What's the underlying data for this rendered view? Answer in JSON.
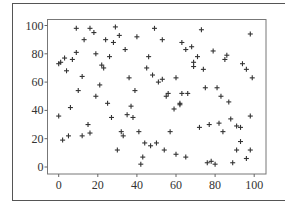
{
  "chart_data": {
    "type": "scatter",
    "title": "",
    "xlabel": "",
    "ylabel": "",
    "xlim": [
      -4,
      106
    ],
    "ylim": [
      -4,
      106
    ],
    "grid": false,
    "legend": null,
    "marker": "+",
    "marker_color": "#333333",
    "x_ticks": [
      0,
      20,
      40,
      60,
      80,
      100
    ],
    "y_ticks": [
      0,
      20,
      40,
      60,
      80,
      100
    ],
    "x_tick_labels": [
      "0",
      "20",
      "40",
      "60",
      "80",
      "100"
    ],
    "y_tick_labels": [
      "0",
      "20",
      "40",
      "60",
      "80",
      "100"
    ],
    "series": [
      {
        "name": "points",
        "points": [
          [
            9,
            98
          ],
          [
            16,
            98
          ],
          [
            18,
            95
          ],
          [
            29,
            99
          ],
          [
            31,
            93
          ],
          [
            13,
            90
          ],
          [
            24,
            90
          ],
          [
            28,
            88
          ],
          [
            40,
            92
          ],
          [
            34,
            83
          ],
          [
            9,
            81
          ],
          [
            19,
            80
          ],
          [
            3,
            77
          ],
          [
            26,
            78
          ],
          [
            7,
            76
          ],
          [
            1,
            74
          ],
          [
            0,
            73
          ],
          [
            22,
            72
          ],
          [
            23,
            70
          ],
          [
            4,
            68
          ],
          [
            12,
            64
          ],
          [
            36,
            63
          ],
          [
            21,
            58
          ],
          [
            10,
            54
          ],
          [
            39,
            54
          ],
          [
            19,
            50
          ],
          [
            25,
            45
          ],
          [
            49,
            98
          ],
          [
            73,
            97
          ],
          [
            98,
            94
          ],
          [
            53,
            90
          ],
          [
            63,
            88
          ],
          [
            68,
            85
          ],
          [
            65,
            83
          ],
          [
            79,
            82
          ],
          [
            86,
            79
          ],
          [
            85,
            76
          ],
          [
            46,
            78
          ],
          [
            71,
            78
          ],
          [
            69,
            74
          ],
          [
            69,
            71
          ],
          [
            74,
            69
          ],
          [
            45,
            70
          ],
          [
            94,
            73
          ],
          [
            96,
            69
          ],
          [
            48,
            65
          ],
          [
            53,
            62
          ],
          [
            51,
            60
          ],
          [
            60,
            63
          ],
          [
            99,
            63
          ],
          [
            75,
            56
          ],
          [
            81,
            56
          ],
          [
            83,
            50
          ],
          [
            56,
            52
          ],
          [
            55,
            50
          ],
          [
            63,
            52
          ],
          [
            66,
            52
          ],
          [
            87,
            46
          ],
          [
            62,
            45
          ],
          [
            37,
            43
          ],
          [
            6,
            42
          ],
          [
            0,
            36
          ],
          [
            27,
            35
          ],
          [
            35,
            37
          ],
          [
            38,
            35
          ],
          [
            15,
            30
          ],
          [
            16,
            24
          ],
          [
            5,
            22
          ],
          [
            2,
            19
          ],
          [
            12,
            22
          ],
          [
            32,
            25
          ],
          [
            33,
            22
          ],
          [
            41,
            25
          ],
          [
            30,
            12
          ],
          [
            43,
            7
          ],
          [
            42,
            2
          ],
          [
            44,
            17
          ],
          [
            59,
            41
          ],
          [
            62,
            44
          ],
          [
            88,
            34
          ],
          [
            98,
            36
          ],
          [
            57,
            25
          ],
          [
            72,
            28
          ],
          [
            77,
            30
          ],
          [
            82,
            31
          ],
          [
            84,
            25
          ],
          [
            91,
            29
          ],
          [
            93,
            28
          ],
          [
            93,
            18
          ],
          [
            91,
            12
          ],
          [
            98,
            12
          ],
          [
            96,
            6
          ],
          [
            47,
            15
          ],
          [
            50,
            17
          ],
          [
            54,
            12
          ],
          [
            60,
            9
          ],
          [
            65,
            7
          ],
          [
            76,
            3
          ],
          [
            78,
            4
          ],
          [
            80,
            2
          ],
          [
            89,
            3
          ]
        ]
      }
    ]
  },
  "figure": {
    "outer_frame_color": "#555555",
    "axes_color": "#666666"
  }
}
